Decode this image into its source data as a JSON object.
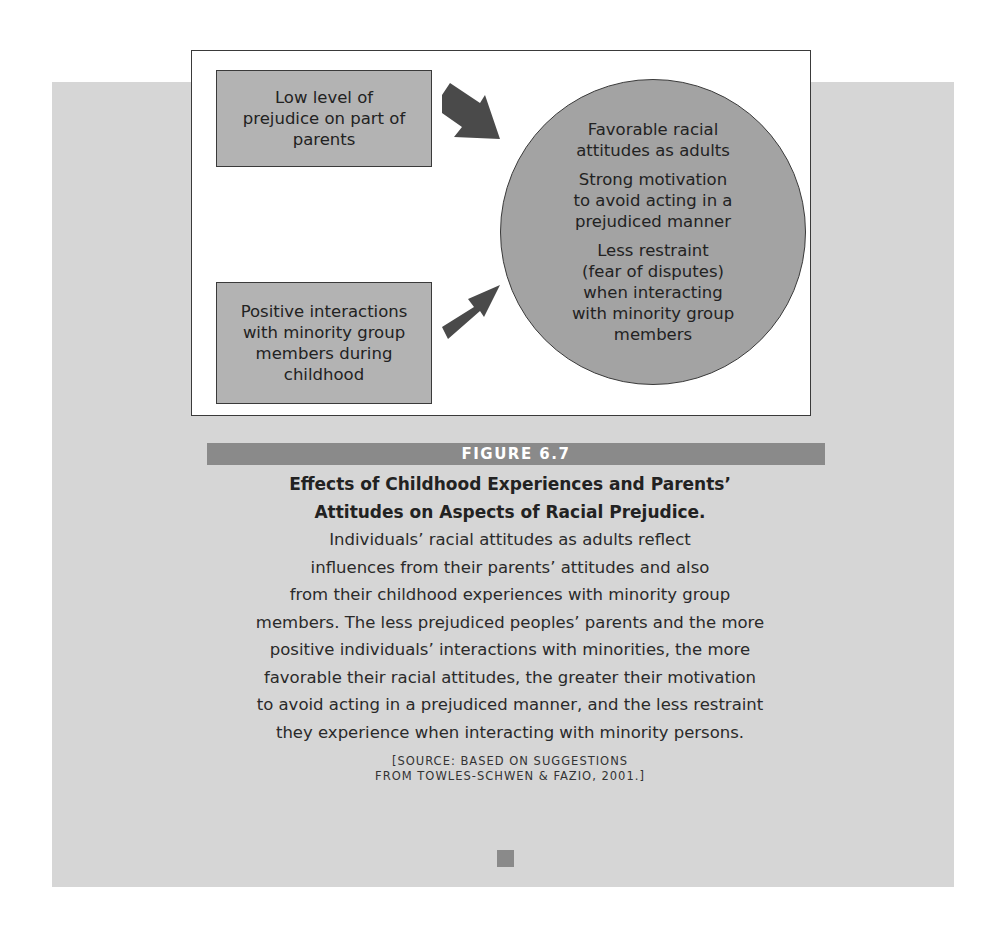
{
  "diagram": {
    "causes": [
      {
        "label": "Low level of\nprejudice on part of\nparents"
      },
      {
        "label": "Positive interactions\nwith minority group\nmembers during\nchildhood"
      }
    ],
    "arrows": [
      "arrow-down-right",
      "arrow-up-right"
    ],
    "outcomes": [
      {
        "label": "Favorable racial\nattitudes as adults"
      },
      {
        "label": "Strong motivation\nto avoid acting in a\nprejudiced manner"
      },
      {
        "label": "Less restraint\n(fear of disputes)\nwhen interacting\nwith minority group\nmembers"
      }
    ],
    "colors": {
      "cause_box": "#b3b3b3",
      "outcome_circle": "#a3a3a3",
      "arrow": "#4a4a4a",
      "background_panel": "#d6d6d6"
    }
  },
  "figure": {
    "label": "FIGURE 6.7",
    "title": "Effects of Childhood Experiences and Parents’\nAttitudes on Aspects of Racial Prejudice.",
    "body": "Individuals’ racial attitudes as adults reflect\ninfluences from their parents’ attitudes and also\nfrom their childhood experiences with minority group\nmembers. The less prejudiced peoples’ parents and the more\npositive individuals’ interactions with minorities, the more\nfavorable their racial attitudes, the greater their motivation\nto avoid acting in a prejudiced manner, and the less restraint\nthey experience when interacting with minority persons.",
    "source": "[SOURCE: BASED ON SUGGESTIONS\nFROM TOWLES-SCHWEN & FAZIO, 2001.]",
    "bar_color": "#8a8a8a"
  }
}
